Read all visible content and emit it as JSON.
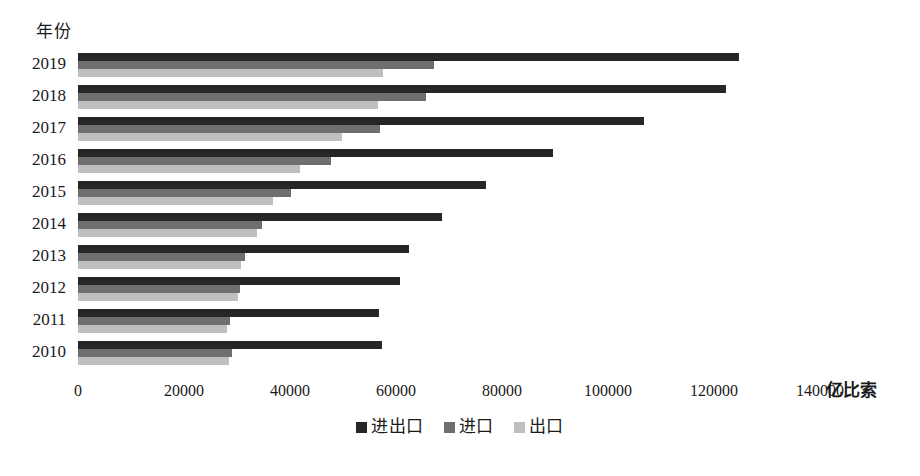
{
  "chart_data": {
    "type": "bar",
    "orientation": "horizontal",
    "title": "",
    "xlabel": "亿比索",
    "ylabel": "年份",
    "xlim": [
      0,
      140000
    ],
    "xticks": [
      0,
      20000,
      40000,
      60000,
      80000,
      100000,
      120000,
      140000
    ],
    "xtick_labels": [
      "0",
      "20000",
      "40000",
      "60000",
      "80000",
      "100000",
      "120000",
      "140000"
    ],
    "grid": false,
    "legend_position": "bottom",
    "categories": [
      "2019",
      "2018",
      "2017",
      "2016",
      "2015",
      "2014",
      "2013",
      "2012",
      "2011",
      "2010"
    ],
    "series": [
      {
        "name": "进出口",
        "color": "#262626",
        "values": [
          124800,
          122200,
          106800,
          89600,
          77000,
          68600,
          62400,
          60800,
          56800,
          57400
        ]
      },
      {
        "name": "进口",
        "color": "#6f6f6f",
        "values": [
          67200,
          65600,
          57000,
          47800,
          40200,
          34800,
          31600,
          30600,
          28600,
          29000
        ]
      },
      {
        "name": "出口",
        "color": "#bfbfbf",
        "values": [
          57600,
          56600,
          49800,
          41800,
          36800,
          33800,
          30800,
          30200,
          28200,
          28400
        ]
      }
    ]
  },
  "colors": {
    "series_0": "#262626",
    "series_1": "#6f6f6f",
    "series_2": "#bfbfbf",
    "background": "#ffffff",
    "text": "#1a1a1a"
  }
}
